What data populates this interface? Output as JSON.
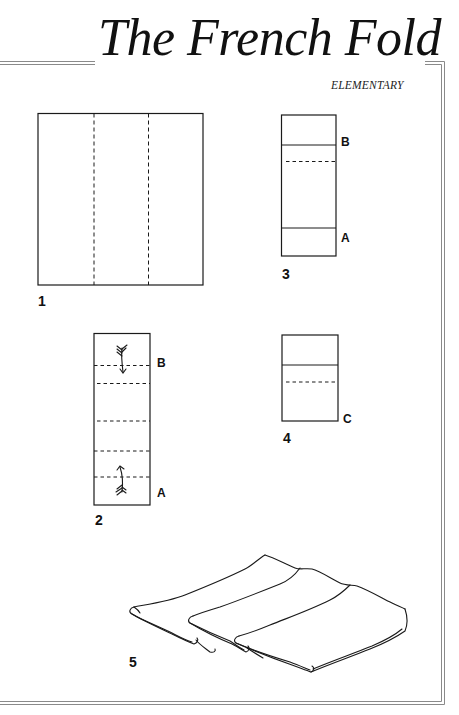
{
  "header": {
    "title": "The French Fold",
    "difficulty": "ELEMENTARY"
  },
  "steps": [
    {
      "number": "1",
      "description": "Square napkin divided into thirds by two vertical fold lines"
    },
    {
      "number": "2",
      "points": [
        "B",
        "A"
      ],
      "description": "Strip with five horizontal fold lines; arrows fold top down and bottom up"
    },
    {
      "number": "3",
      "points": [
        "B",
        "A"
      ],
      "description": "Strip with top and bottom folded, one dashed fold line"
    },
    {
      "number": "4",
      "points": [
        "C"
      ],
      "description": "Shortened strip with one dashed fold line"
    },
    {
      "number": "5",
      "description": "Finished folded napkin pleated into three layers"
    }
  ],
  "colors": {
    "line": "#1a1a1a",
    "border": "#8a8a8a",
    "background": "#ffffff"
  }
}
